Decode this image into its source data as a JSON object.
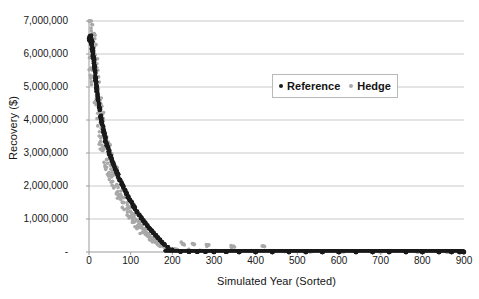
{
  "chart_data": {
    "type": "scatter",
    "title": "",
    "xlabel": "Simulated Year (Sorted)",
    "ylabel": "Recovery ($)",
    "xlim": [
      0,
      900
    ],
    "ylim": [
      0,
      7000000
    ],
    "grid": true,
    "legend_position": "top-center-right",
    "x_ticks": [
      "0",
      "100",
      "200",
      "300",
      "400",
      "500",
      "600",
      "700",
      "800",
      "900"
    ],
    "x_tick_values": [
      0,
      100,
      200,
      300,
      400,
      500,
      600,
      700,
      800,
      900
    ],
    "y_ticks": [
      "-",
      "1,000,000",
      "2,000,000",
      "3,000,000",
      "4,000,000",
      "5,000,000",
      "6,000,000",
      "7,000,000"
    ],
    "y_tick_values": [
      0,
      1000000,
      2000000,
      3000000,
      4000000,
      5000000,
      6000000,
      7000000
    ],
    "series": [
      {
        "name": "Reference",
        "color": "#1a1a1a",
        "marker": "dot",
        "marker_size": 2.2,
        "x": [
          1,
          2,
          3,
          4,
          5,
          6,
          7,
          8,
          9,
          10,
          11,
          12,
          13,
          14,
          15,
          16,
          17,
          18,
          19,
          20,
          22,
          24,
          26,
          28,
          30,
          32,
          34,
          36,
          38,
          40,
          43,
          46,
          49,
          52,
          55,
          58,
          61,
          64,
          67,
          70,
          74,
          78,
          82,
          86,
          90,
          94,
          98,
          102,
          106,
          110,
          115,
          120,
          125,
          130,
          135,
          140,
          145,
          150,
          155,
          160,
          165,
          170,
          175,
          180,
          190,
          200,
          220,
          240,
          260,
          280,
          300,
          330,
          360,
          400,
          440,
          480,
          520,
          560,
          600,
          640,
          680,
          720,
          760,
          800,
          840,
          870,
          890,
          899
        ],
        "values": [
          6520000,
          6510000,
          6480000,
          6460000,
          6440000,
          6400000,
          6350000,
          6280000,
          6180000,
          6050000,
          5930000,
          5820000,
          5700000,
          5560000,
          5420000,
          5300000,
          5180000,
          5060000,
          4940000,
          4830000,
          4640000,
          4470000,
          4300000,
          4150000,
          4020000,
          3890000,
          3760000,
          3640000,
          3530000,
          3420000,
          3270000,
          3130000,
          3010000,
          2900000,
          2800000,
          2700000,
          2600000,
          2500000,
          2410000,
          2320000,
          2200000,
          2090000,
          1980000,
          1880000,
          1780000,
          1680000,
          1590000,
          1500000,
          1410000,
          1330000,
          1230000,
          1140000,
          1050000,
          960000,
          880000,
          800000,
          720000,
          650000,
          580000,
          510000,
          440000,
          370000,
          300000,
          240000,
          140000,
          60000,
          15000,
          8000,
          5000,
          4000,
          3000,
          2500,
          2000,
          1800,
          1500,
          1200,
          1000,
          900,
          800,
          700,
          600,
          500,
          400,
          350,
          300,
          250,
          200,
          150
        ]
      },
      {
        "name": "Hedge",
        "color": "#a8a8a8",
        "marker": "dot",
        "marker_size": 1.8,
        "x": [
          1,
          3,
          5,
          7,
          9,
          11,
          13,
          15,
          17,
          19,
          21,
          23,
          25,
          27,
          29,
          31,
          33,
          35,
          37,
          39,
          42,
          45,
          48,
          51,
          54,
          57,
          60,
          63,
          66,
          69,
          72,
          76,
          80,
          84,
          88,
          92,
          96,
          100,
          104,
          108,
          112,
          117,
          122,
          127,
          132,
          137,
          142,
          147,
          152,
          157,
          162,
          167,
          172,
          178,
          184,
          192,
          198,
          205,
          212,
          225,
          238,
          252,
          268,
          285,
          305,
          345,
          385,
          420,
          470,
          530,
          610,
          700,
          790,
          860
        ],
        "values": [
          6420000,
          6300000,
          6250000,
          6150000,
          5950000,
          5760000,
          5660000,
          5380000,
          5200000,
          4900000,
          4800000,
          4550000,
          4400000,
          4050000,
          3970000,
          3720000,
          3640000,
          3480000,
          3360000,
          3180000,
          3080000,
          2990000,
          2820000,
          2740000,
          2540000,
          2460000,
          2380000,
          2280000,
          2170000,
          2060000,
          1930000,
          1820000,
          1710000,
          1630000,
          1500000,
          1400000,
          1280000,
          1190000,
          1120000,
          1020000,
          940000,
          870000,
          780000,
          700000,
          620000,
          560000,
          490000,
          430000,
          380000,
          330000,
          290000,
          250000,
          210000,
          170000,
          140000,
          110000,
          95000,
          80000,
          70000,
          250000,
          55000,
          240000,
          40000,
          210000,
          35000,
          170000,
          25000,
          160000,
          18000,
          12000,
          9000,
          7000,
          5000,
          4000
        ]
      }
    ]
  }
}
